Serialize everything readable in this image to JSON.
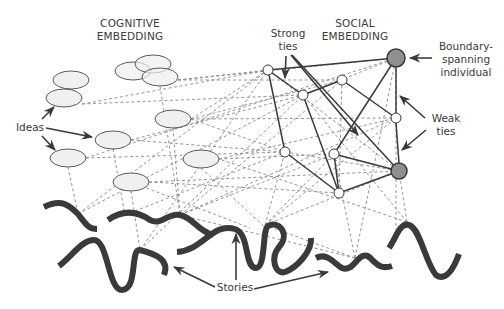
{
  "labels": {
    "cognitive_line1": "COGNITIVE",
    "cognitive_line2": "EMBEDDING",
    "social_line1": "SOCIAL",
    "social_line2": "EMBEDDING",
    "strong_line1": "Strong",
    "strong_line2": "ties",
    "boundary_line1": "Boundary-",
    "boundary_line2": "spanning",
    "boundary_line3": "individual",
    "weak_line1": "Weak",
    "weak_line2": "ties",
    "ideas": "Ideas",
    "stories": "Stories"
  },
  "colors": {
    "ink": "#3a3a3a",
    "dashed": "#8a8a8a",
    "ellipse_fill": "#f0f0f0",
    "boundary_node_fill": "#8f8f8f",
    "node_fill": "#ffffff"
  },
  "ideas": [
    {
      "cx": 71,
      "cy": 80,
      "rx": 18,
      "ry": 9
    },
    {
      "cx": 64,
      "cy": 98,
      "rx": 18,
      "ry": 9
    },
    {
      "cx": 133,
      "cy": 71,
      "rx": 18,
      "ry": 9
    },
    {
      "cx": 153,
      "cy": 64,
      "rx": 18,
      "ry": 9
    },
    {
      "cx": 160,
      "cy": 77,
      "rx": 18,
      "ry": 9
    },
    {
      "cx": 173,
      "cy": 119,
      "rx": 18,
      "ry": 9
    },
    {
      "cx": 113,
      "cy": 140,
      "rx": 18,
      "ry": 9
    },
    {
      "cx": 68,
      "cy": 158,
      "rx": 18,
      "ry": 9
    },
    {
      "cx": 201,
      "cy": 159,
      "rx": 18,
      "ry": 9
    },
    {
      "cx": 131,
      "cy": 182,
      "rx": 18,
      "ry": 9
    }
  ],
  "social_nodes": [
    {
      "id": "a",
      "cx": 268,
      "cy": 70,
      "r": 5
    },
    {
      "id": "b",
      "cx": 303,
      "cy": 95,
      "r": 5
    },
    {
      "id": "c",
      "cx": 342,
      "cy": 80,
      "r": 5
    },
    {
      "id": "d",
      "cx": 396,
      "cy": 118,
      "r": 5
    },
    {
      "id": "e",
      "cx": 285,
      "cy": 152,
      "r": 5
    },
    {
      "id": "f",
      "cx": 334,
      "cy": 154,
      "r": 5
    },
    {
      "id": "g",
      "cx": 339,
      "cy": 193,
      "r": 5
    },
    {
      "id": "B1",
      "cx": 396,
      "cy": 58,
      "r": 9,
      "boundary": true
    },
    {
      "id": "B2",
      "cx": 399,
      "cy": 171,
      "r": 8,
      "boundary": true
    }
  ]
}
